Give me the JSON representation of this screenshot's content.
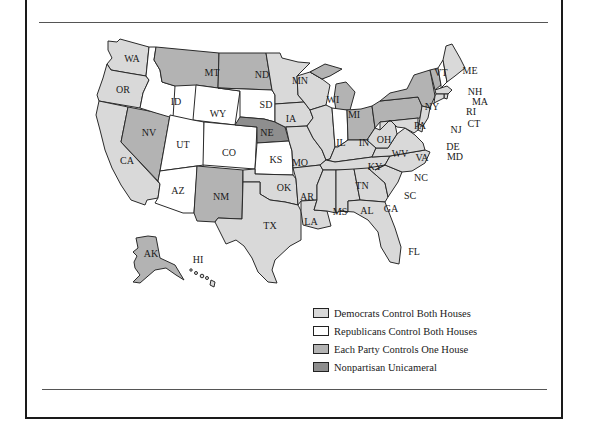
{
  "legend": {
    "items": [
      {
        "key": "dem",
        "label": "Democrats Control Both Houses",
        "color": "#d9d9d9"
      },
      {
        "key": "rep",
        "label": "Republicans Control Both Houses",
        "color": "#ffffff"
      },
      {
        "key": "split",
        "label": "Each Party Controls One House",
        "color": "#b3b3b3"
      },
      {
        "key": "nonpartisan",
        "label": "Nonpartisan Unicameral",
        "color": "#8e8e8e"
      }
    ]
  },
  "states": {
    "WA": "dem",
    "OR": "dem",
    "CA": "dem",
    "NV": "split",
    "ID": "rep",
    "MT": "split",
    "WY": "rep",
    "UT": "rep",
    "AZ": "rep",
    "CO": "rep",
    "NM": "split",
    "ND": "split",
    "SD": "rep",
    "NE": "nonpartisan",
    "KS": "rep",
    "OK": "dem",
    "TX": "dem",
    "MN": "dem",
    "IA": "dem",
    "MO": "dem",
    "AR": "dem",
    "LA": "dem",
    "WI": "dem",
    "IL": "dem",
    "MI": "split",
    "IN": "rep",
    "OH": "split",
    "KY": "dem",
    "TN": "dem",
    "MS": "dem",
    "AL": "dem",
    "GA": "dem",
    "FL": "dem",
    "SC": "dem",
    "NC": "dem",
    "VA": "dem",
    "WV": "dem",
    "PA": "split",
    "NY": "split",
    "VT": "split",
    "NH": "rep",
    "ME": "dem",
    "MA": "dem",
    "RI": "dem",
    "CT": "dem",
    "NJ": "dem",
    "DE": "dem",
    "MD": "dem",
    "AK": "split",
    "HI": "dem"
  },
  "labels": {
    "WA": "WA",
    "OR": "OR",
    "CA": "CA",
    "NV": "NV",
    "ID": "ID",
    "MT": "MT",
    "WY": "WY",
    "UT": "UT",
    "AZ": "AZ",
    "CO": "CO",
    "NM": "NM",
    "ND": "ND",
    "SD": "SD",
    "NE": "NE",
    "KS": "KS",
    "OK": "OK",
    "TX": "TX",
    "MN": "MN",
    "IA": "IA",
    "MO": "MO",
    "AR": "AR",
    "LA": "LA",
    "WI": "WI",
    "IL": "IL",
    "MI": "MI",
    "IN": "IN",
    "OH": "OH",
    "KY": "KY",
    "TN": "TN",
    "MS": "MS",
    "AL": "AL",
    "GA": "GA",
    "FL": "FL",
    "SC": "SC",
    "NC": "NC",
    "VA": "VA",
    "WV": "WV",
    "PA": "PA",
    "NY": "NY",
    "VT": "VT",
    "NH": "NH",
    "ME": "ME",
    "MA": "MA",
    "RI": "RI",
    "CT": "CT",
    "NJ": "NJ",
    "DE": "DE",
    "MD": "MD",
    "AK": "AK",
    "HI": "HI"
  }
}
